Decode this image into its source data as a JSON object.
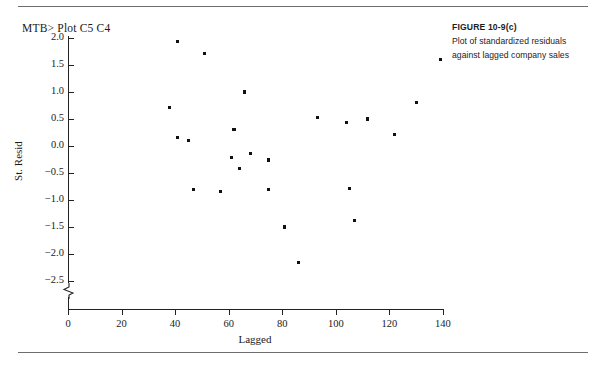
{
  "prompt": {
    "text": "MTB> Plot C5 C4"
  },
  "caption": {
    "figure_label": "FIGURE 10-9(c)",
    "line1": "Plot of standardized residuals",
    "line2": "against lagged company sales"
  },
  "chart_data": {
    "type": "scatter",
    "title": "",
    "xlabel": "Lagged",
    "ylabel": "St. Resid",
    "xlim": [
      0,
      143
    ],
    "ylim": [
      -2.6,
      2.0
    ],
    "xticks": [
      0,
      20,
      40,
      60,
      80,
      100,
      120,
      140
    ],
    "ytick_labels": [
      "2.0",
      "1.5",
      "1.0",
      "0.5",
      "0.0",
      "-0.5",
      "-1.0",
      "-1.5",
      "-2.0",
      "-2.5"
    ],
    "yticks": [
      2.0,
      1.5,
      1.0,
      0.5,
      0.0,
      -0.5,
      -1.0,
      -1.5,
      -2.0,
      -2.5
    ],
    "grid": false,
    "legend": null,
    "axis_break": "y-axis broken below -2.5",
    "marker": "square-dot",
    "marker_color": "#111111",
    "points": [
      {
        "x": 41,
        "y": 1.93
      },
      {
        "x": 51,
        "y": 1.72
      },
      {
        "x": 139,
        "y": 1.6
      },
      {
        "x": 38,
        "y": 0.72
      },
      {
        "x": 66,
        "y": 1.0
      },
      {
        "x": 130,
        "y": 0.8
      },
      {
        "x": 93,
        "y": 0.52
      },
      {
        "x": 112,
        "y": 0.5
      },
      {
        "x": 104,
        "y": 0.43
      },
      {
        "x": 122,
        "y": 0.22
      },
      {
        "x": 41,
        "y": 0.15
      },
      {
        "x": 45,
        "y": 0.11
      },
      {
        "x": 62,
        "y": 0.3
      },
      {
        "x": 68,
        "y": -0.14
      },
      {
        "x": 75,
        "y": -0.26
      },
      {
        "x": 64,
        "y": -0.42
      },
      {
        "x": 61,
        "y": -0.22
      },
      {
        "x": 47,
        "y": -0.8
      },
      {
        "x": 57,
        "y": -0.85
      },
      {
        "x": 75,
        "y": -0.8
      },
      {
        "x": 105,
        "y": -0.78
      },
      {
        "x": 81,
        "y": -1.5
      },
      {
        "x": 107,
        "y": -1.38
      },
      {
        "x": 86,
        "y": -2.15
      }
    ]
  }
}
